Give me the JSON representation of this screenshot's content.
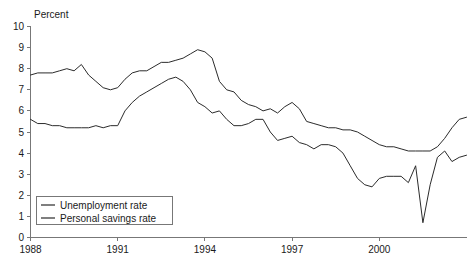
{
  "chart_data": {
    "type": "line",
    "title": "",
    "ylabel": "Percent",
    "xlabel": "",
    "ylim": [
      0,
      10
    ],
    "xlim": [
      1988.0,
      2003.0
    ],
    "yticks": [
      "0",
      "1",
      "2",
      "3",
      "4",
      "5",
      "6",
      "7",
      "8",
      "9",
      "10"
    ],
    "xticks": [
      "1988",
      "1991",
      "1994",
      "1997",
      "2000"
    ],
    "xtick_values": [
      1988,
      1991,
      1994,
      1997,
      2000
    ],
    "grid": false,
    "legend_position": "bottom-left",
    "series": [
      {
        "name": "Unemployment rate",
        "color": "#2b2b2b",
        "x": [
          1988.0,
          1988.25,
          1988.5,
          1988.75,
          1989.0,
          1989.25,
          1989.5,
          1989.75,
          1990.0,
          1990.25,
          1990.5,
          1990.75,
          1991.0,
          1991.25,
          1991.5,
          1991.75,
          1992.0,
          1992.25,
          1992.5,
          1992.75,
          1993.0,
          1993.25,
          1993.5,
          1993.75,
          1994.0,
          1994.25,
          1994.5,
          1994.75,
          1995.0,
          1995.25,
          1995.5,
          1995.75,
          1996.0,
          1996.25,
          1996.5,
          1996.75,
          1997.0,
          1997.25,
          1997.5,
          1997.75,
          1998.0,
          1998.25,
          1998.5,
          1998.75,
          1999.0,
          1999.25,
          1999.5,
          1999.75,
          2000.0,
          2000.25,
          2000.5,
          2000.75,
          2001.0,
          2001.25,
          2001.5,
          2001.75,
          2002.0,
          2002.25,
          2002.5,
          2002.75,
          2003.0
        ],
        "values": [
          7.7,
          7.8,
          7.8,
          7.8,
          7.9,
          8.0,
          7.9,
          8.2,
          7.7,
          7.4,
          7.1,
          7.0,
          7.1,
          7.5,
          7.8,
          7.9,
          7.9,
          8.1,
          8.3,
          8.3,
          8.4,
          8.5,
          8.7,
          8.9,
          8.8,
          8.5,
          7.4,
          7.0,
          6.9,
          6.5,
          6.3,
          6.2,
          6.0,
          6.1,
          5.9,
          6.2,
          6.4,
          6.1,
          5.5,
          5.4,
          5.3,
          5.2,
          5.2,
          5.1,
          5.1,
          5.0,
          4.8,
          4.6,
          4.4,
          4.3,
          4.3,
          4.2,
          4.1,
          4.1,
          4.1,
          4.1,
          4.3,
          4.7,
          5.2,
          5.6,
          5.7
        ]
      },
      {
        "name": "Personal savings rate",
        "color": "#2b2b2b",
        "x": [
          1988.0,
          1988.25,
          1988.5,
          1988.75,
          1989.0,
          1989.25,
          1989.5,
          1989.75,
          1990.0,
          1990.25,
          1990.5,
          1990.75,
          1991.0,
          1991.25,
          1991.5,
          1991.75,
          1992.0,
          1992.25,
          1992.5,
          1992.75,
          1993.0,
          1993.25,
          1993.5,
          1993.75,
          1994.0,
          1994.25,
          1994.5,
          1994.75,
          1995.0,
          1995.25,
          1995.5,
          1995.75,
          1996.0,
          1996.25,
          1996.5,
          1996.75,
          1997.0,
          1997.25,
          1997.5,
          1997.75,
          1998.0,
          1998.25,
          1998.5,
          1998.75,
          1999.0,
          1999.25,
          1999.5,
          1999.75,
          2000.0,
          2000.25,
          2000.5,
          2000.75,
          2001.0,
          2001.25,
          2001.5,
          2001.75,
          2002.0,
          2002.25,
          2002.5,
          2002.75,
          2003.0
        ],
        "values": [
          5.6,
          5.4,
          5.4,
          5.3,
          5.3,
          5.2,
          5.2,
          5.2,
          5.2,
          5.3,
          5.2,
          5.3,
          5.3,
          6.0,
          6.4,
          6.7,
          6.9,
          7.1,
          7.3,
          7.5,
          7.6,
          7.4,
          7.0,
          6.4,
          6.2,
          5.9,
          6.0,
          5.6,
          5.3,
          5.3,
          5.4,
          5.6,
          5.6,
          5.0,
          4.6,
          4.7,
          4.8,
          4.5,
          4.4,
          4.2,
          4.4,
          4.4,
          4.3,
          4.0,
          3.4,
          2.8,
          2.5,
          2.4,
          2.8,
          2.9,
          2.9,
          2.9,
          2.6,
          3.4,
          0.7,
          2.5,
          3.8,
          4.1,
          3.6,
          3.8,
          3.9
        ]
      }
    ]
  },
  "legend": {
    "items": [
      {
        "label": "Unemployment rate"
      },
      {
        "label": "Personal savings rate"
      }
    ]
  },
  "axis": {
    "y_title": "Percent"
  }
}
